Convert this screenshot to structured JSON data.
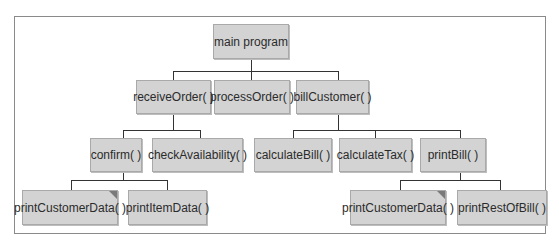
{
  "diagram": {
    "type": "hierarchy-chart",
    "colors": {
      "node_fill": "#d3d3d3",
      "node_border": "#a9a9a9",
      "connector": "#333333",
      "frame": "#8a8a8a"
    },
    "root": {
      "label": "main program"
    },
    "level2": [
      {
        "label": "receiveOrder( )"
      },
      {
        "label": "processOrder( )"
      },
      {
        "label": "billCustomer( )"
      }
    ],
    "level3": [
      {
        "label": "confirm( )",
        "parent": "receiveOrder( )"
      },
      {
        "label": "checkAvailability( )",
        "parent": "receiveOrder( )"
      },
      {
        "label": "calculateBill( )",
        "parent": "billCustomer( )"
      },
      {
        "label": "calculateTax( )",
        "parent": "billCustomer( )"
      },
      {
        "label": "printBill( )",
        "parent": "billCustomer( )"
      }
    ],
    "level4": [
      {
        "label": "printCustomerData( )",
        "parent": "confirm( )",
        "shared_marker": true
      },
      {
        "label": "printItemData( )",
        "parent": "confirm( )"
      },
      {
        "label": "printCustomerData( )",
        "parent": "printBill( )",
        "shared_marker": true
      },
      {
        "label": "printRestOfBill( )",
        "parent": "printBill( )"
      }
    ]
  }
}
